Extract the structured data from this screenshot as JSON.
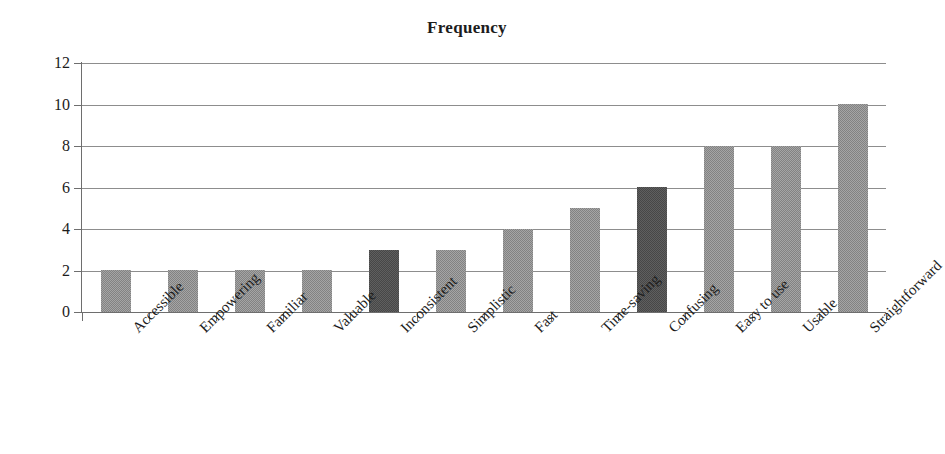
{
  "chart_data": {
    "type": "bar",
    "title": "Frequency",
    "xlabel": "",
    "ylabel": "",
    "ylim": [
      0,
      12
    ],
    "ytick_step": 2,
    "yticks": [
      0,
      2,
      4,
      6,
      8,
      10,
      12
    ],
    "grid": true,
    "legend": "none",
    "categories": [
      "Accessible",
      "Empowering",
      "Familiar",
      "Valuable",
      "Inconsistent",
      "Simplistic",
      "Fast",
      "Time-saving",
      "Confusing",
      "Easy to use",
      "Usable",
      "Straightforward"
    ],
    "values": [
      2,
      2,
      2,
      2,
      3,
      3,
      4,
      5,
      6,
      8,
      8,
      10
    ],
    "bar_styles": [
      "medium",
      "medium",
      "medium",
      "medium",
      "dark",
      "medium",
      "medium",
      "medium",
      "dark",
      "medium",
      "medium",
      "medium"
    ],
    "colors": {
      "bar_medium": "#828282",
      "bar_dark": "#474747",
      "gridline": "#8d8d8d",
      "axis": "#6e6e6e",
      "text": "#1c1c1c",
      "background": "#ffffff"
    }
  }
}
